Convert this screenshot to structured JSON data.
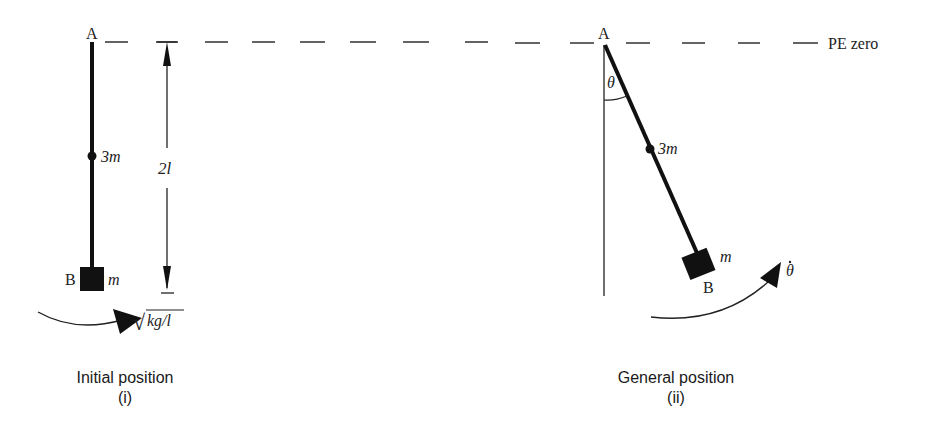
{
  "diagram": {
    "datum_label": "PE zero",
    "panel_i": {
      "caption": "Initial position",
      "sub": "(i)",
      "pivot_label": "A",
      "end_label": "B",
      "mid_mass": "3m",
      "end_mass": "m",
      "length_label": "2l",
      "angular_velocity_label": "√kg/l",
      "sqrt_symbol": "√",
      "sqrt_arg": "kg/l"
    },
    "panel_ii": {
      "caption": "General position",
      "sub": "(ii)",
      "pivot_label": "A",
      "end_label": "B",
      "mid_mass": "3m",
      "end_mass": "m",
      "angle_label": "θ",
      "angular_velocity_label": "θ̇"
    }
  }
}
